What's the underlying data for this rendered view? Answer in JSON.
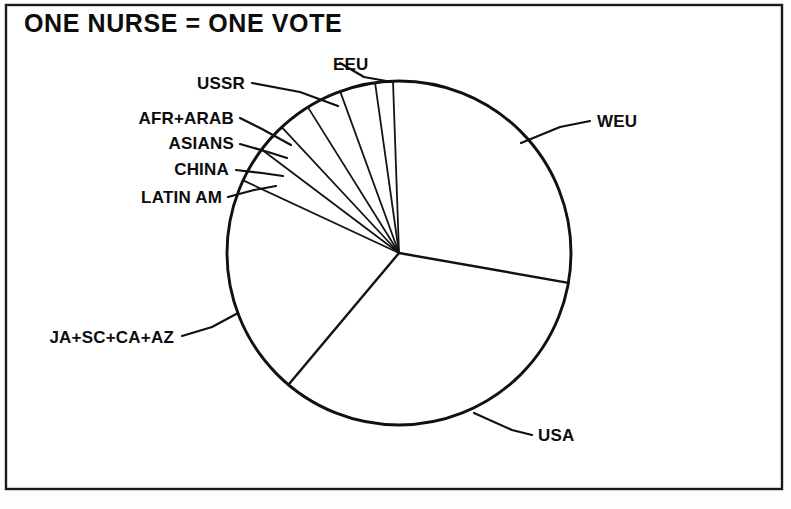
{
  "figure": {
    "title": "ONE NURSE = ONE VOTE",
    "title_x": 24,
    "title_y": 32,
    "frame": {
      "x": 6,
      "y": 5,
      "width": 776,
      "height": 484
    },
    "background_color": "#fdfdfb",
    "ink_color": "#111111"
  },
  "chart_data": {
    "type": "pie",
    "title": "ONE NURSE = ONE VOTE",
    "xlabel": "",
    "ylabel": "",
    "grid": false,
    "legend_position": "callout-labels",
    "units": "share of votes (one nurse = one vote)",
    "center": {
      "x": 399,
      "y": 253
    },
    "radius": 172,
    "start_angle_deg": -92,
    "direction": "clockwise",
    "categories": [
      "WEU",
      "USA",
      "JA+SC+CA+AZ",
      "LATIN AM",
      "CHINA",
      "ASIANS",
      "AFR+ARAB",
      "USSR",
      "EEU"
    ],
    "values": [
      28.3,
      33.3,
      20.8,
      3.3,
      2.8,
      3.1,
      3.3,
      3.3,
      1.8
    ],
    "slices": [
      {
        "label": "WEU",
        "value": 28.3,
        "start_deg": -92.0,
        "end_deg": 10.0,
        "label_side": "right"
      },
      {
        "label": "USA",
        "value": 33.3,
        "start_deg": 10.0,
        "end_deg": 130.0,
        "label_side": "right"
      },
      {
        "label": "JA+SC+CA+AZ",
        "value": 20.8,
        "start_deg": 130.0,
        "end_deg": 205.0,
        "label_side": "left"
      },
      {
        "label": "LATIN AM",
        "value": 3.3,
        "start_deg": 205.0,
        "end_deg": 217.0,
        "label_side": "left"
      },
      {
        "label": "CHINA",
        "value": 2.8,
        "start_deg": 217.0,
        "end_deg": 227.0,
        "label_side": "left"
      },
      {
        "label": "ASIANS",
        "value": 3.1,
        "start_deg": 227.0,
        "end_deg": 238.0,
        "label_side": "left"
      },
      {
        "label": "AFR+ARAB",
        "value": 3.3,
        "start_deg": 238.0,
        "end_deg": 250.0,
        "label_side": "left"
      },
      {
        "label": "USSR",
        "value": 3.3,
        "start_deg": 250.0,
        "end_deg": 262.0,
        "label_side": "left"
      },
      {
        "label": "EEU",
        "value": 1.8,
        "start_deg": 262.0,
        "end_deg": 268.0,
        "label_side": "right"
      }
    ]
  },
  "labels": {
    "eeu": {
      "text": "EEU",
      "x": 333,
      "y": 70,
      "anchor": "end",
      "leader": "M 340,63 L 364,77 L 392,82"
    },
    "ussr": {
      "text": "USSR",
      "x": 245,
      "y": 89,
      "anchor": "end",
      "leader": "M 252,83 L 300,92 L 338,106"
    },
    "afr_arab": {
      "text": "AFR+ARAB",
      "x": 234,
      "y": 124,
      "anchor": "end",
      "leader": "M 240,118 L 262,129 L 291,145"
    },
    "asians": {
      "text": "ASIANS",
      "x": 234,
      "y": 149,
      "anchor": "end",
      "leader": "M 240,144 L 268,152 L 287,158"
    },
    "china": {
      "text": "CHINA",
      "x": 229,
      "y": 175,
      "anchor": "end",
      "leader": "M 236,170 L 262,173 L 283,176"
    },
    "latin_am": {
      "text": "LATIN AM",
      "x": 222,
      "y": 203,
      "anchor": "end",
      "leader": "M 228,197 L 254,190 L 276,186"
    },
    "weu": {
      "text": "WEU",
      "x": 597,
      "y": 127,
      "anchor": "start",
      "leader": "M 590,121 L 560,127 L 521,143"
    },
    "usa": {
      "text": "USA",
      "x": 538,
      "y": 441,
      "anchor": "start",
      "leader": "M 532,435 L 512,430 L 474,413"
    },
    "ja_sc_ca_az": {
      "text": "JA+SC+CA+AZ",
      "x": 174,
      "y": 343,
      "anchor": "end",
      "leader": "M 182,336 L 212,327 L 238,313"
    }
  }
}
